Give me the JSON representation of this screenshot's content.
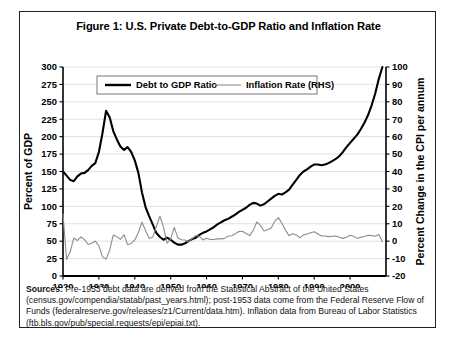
{
  "figure": {
    "title": "Figure 1: U.S. Private Debt-to-GDP Ratio and Inflation Rate",
    "sources_label": "Sources:",
    "sources_text": " Pre-1953 debt data are derived from the Statistical Abstract of the United States (census.gov/compendia/statab/past_years.html); post-1953 data come from the Federal Reserve Flow of Funds (federalreserve.gov/releases/z1/Current/data.htm). Inflation data from Bureau of Labor Statistics (ftb.bls.gov/pub/special.requests/epi/epiai.txt)."
  },
  "colors": {
    "debt_line": "#000000",
    "inflation_line": "#8c8c8c",
    "gridline": "#d9d9d9",
    "axis": "#000000",
    "frame": "#222222"
  },
  "chart_data": {
    "type": "line",
    "title": "Figure 1: U.S. Private Debt-to-GDP Ratio and Inflation Rate",
    "xlabel": "",
    "ylabel": "Percent of GDP",
    "y2label": "Percent Change in the CPI per annum",
    "xlim": [
      1920,
      2010
    ],
    "ylim": [
      0,
      300
    ],
    "y2lim": [
      -20,
      100
    ],
    "yticks": [
      0,
      25,
      50,
      75,
      100,
      125,
      150,
      175,
      200,
      225,
      250,
      275,
      300
    ],
    "y2ticks": [
      -20,
      -10,
      0,
      10,
      20,
      30,
      40,
      50,
      60,
      70,
      80,
      90,
      100
    ],
    "xticks": [
      1920,
      1930,
      1940,
      1950,
      1960,
      1970,
      1980,
      1990,
      2000
    ],
    "xtick_labels": [
      "1920",
      "1930",
      "1940",
      "1950",
      "1960",
      "1970",
      "1980",
      "1990",
      "2000"
    ],
    "grid": "horizontal",
    "legend_position": "top-center",
    "series": [
      {
        "name": "Debt to GDP Ratio",
        "axis": "left",
        "color": "#000000",
        "width": 2.1,
        "x": [
          1920,
          1921,
          1922,
          1923,
          1924,
          1925,
          1926,
          1927,
          1928,
          1929,
          1930,
          1931,
          1932,
          1933,
          1934,
          1935,
          1936,
          1937,
          1938,
          1939,
          1940,
          1941,
          1942,
          1943,
          1944,
          1945,
          1946,
          1947,
          1948,
          1949,
          1950,
          1951,
          1952,
          1953,
          1954,
          1955,
          1956,
          1957,
          1958,
          1959,
          1960,
          1961,
          1962,
          1963,
          1964,
          1965,
          1966,
          1967,
          1968,
          1969,
          1970,
          1971,
          1972,
          1973,
          1974,
          1975,
          1976,
          1977,
          1978,
          1979,
          1980,
          1981,
          1982,
          1983,
          1984,
          1985,
          1986,
          1987,
          1988,
          1989,
          1990,
          1991,
          1992,
          1993,
          1994,
          1995,
          1996,
          1997,
          1998,
          1999,
          2000,
          2001,
          2002,
          2003,
          2004,
          2005,
          2006,
          2007,
          2008,
          2009
        ],
        "values": [
          150,
          144,
          138,
          136,
          143,
          147,
          148,
          152,
          158,
          162,
          178,
          205,
          237,
          228,
          208,
          196,
          186,
          181,
          185,
          178,
          166,
          148,
          120,
          99,
          86,
          74,
          62,
          56,
          52,
          55,
          52,
          48,
          45,
          45,
          47,
          50,
          53,
          55,
          59,
          62,
          64,
          67,
          70,
          74,
          77,
          80,
          82,
          85,
          88,
          92,
          95,
          98,
          102,
          105,
          104,
          101,
          103,
          107,
          111,
          115,
          118,
          117,
          120,
          124,
          131,
          138,
          145,
          150,
          153,
          157,
          160,
          160,
          159,
          160,
          162,
          165,
          168,
          172,
          178,
          185,
          191,
          197,
          203,
          211,
          220,
          231,
          245,
          262,
          283,
          300
        ]
      },
      {
        "name": "Inflation Rate (RHS)",
        "axis": "right",
        "color": "#8c8c8c",
        "width": 1.1,
        "x": [
          1920,
          1921,
          1922,
          1923,
          1924,
          1925,
          1926,
          1927,
          1928,
          1929,
          1930,
          1931,
          1932,
          1933,
          1934,
          1935,
          1936,
          1937,
          1938,
          1939,
          1940,
          1941,
          1942,
          1943,
          1944,
          1945,
          1946,
          1947,
          1948,
          1949,
          1950,
          1951,
          1952,
          1953,
          1954,
          1955,
          1956,
          1957,
          1958,
          1959,
          1960,
          1961,
          1962,
          1963,
          1964,
          1965,
          1966,
          1967,
          1968,
          1969,
          1970,
          1971,
          1972,
          1973,
          1974,
          1975,
          1976,
          1977,
          1978,
          1979,
          1980,
          1981,
          1982,
          1983,
          1984,
          1985,
          1986,
          1987,
          1988,
          1989,
          1990,
          1991,
          1992,
          1993,
          1994,
          1995,
          1996,
          1997,
          1998,
          1999,
          2000,
          2001,
          2002,
          2003,
          2004,
          2005,
          2006,
          2007,
          2008,
          2009
        ],
        "values": [
          15.6,
          -10.5,
          -6.1,
          1.8,
          0.4,
          2.4,
          0.9,
          -1.9,
          -1.2,
          0.0,
          -2.7,
          -8.9,
          -10.3,
          -5.2,
          3.5,
          2.6,
          1.0,
          3.7,
          -2.0,
          -1.3,
          0.7,
          5.0,
          10.9,
          6.1,
          1.7,
          2.3,
          8.3,
          14.4,
          8.1,
          -1.2,
          1.3,
          7.9,
          1.9,
          0.8,
          0.7,
          -0.4,
          1.5,
          3.3,
          2.8,
          0.7,
          1.7,
          1.0,
          1.0,
          1.3,
          1.3,
          1.6,
          2.9,
          3.1,
          4.2,
          5.5,
          5.7,
          4.4,
          3.2,
          6.2,
          11.0,
          9.1,
          5.8,
          6.5,
          7.6,
          11.3,
          13.5,
          10.3,
          6.2,
          3.2,
          4.3,
          3.6,
          1.9,
          3.6,
          4.1,
          4.8,
          5.4,
          4.2,
          3.0,
          3.0,
          2.6,
          2.8,
          3.0,
          2.3,
          1.6,
          2.2,
          3.4,
          2.8,
          1.6,
          2.3,
          2.7,
          3.4,
          3.2,
          2.8,
          3.8,
          -0.4
        ]
      }
    ],
    "legend": [
      {
        "label": "Debt to GDP Ratio",
        "color": "#000000",
        "width": 2.4
      },
      {
        "label": "Inflation Rate (RHS)",
        "color": "#8c8c8c",
        "width": 1.1
      }
    ]
  }
}
